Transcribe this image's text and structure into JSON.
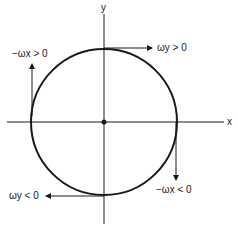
{
  "diagram": {
    "type": "circle-with-axes",
    "axes": {
      "x_label": "x",
      "y_label": "y"
    },
    "annotations": [
      {
        "id": "top",
        "label": "ωy > 0",
        "direction": "right"
      },
      {
        "id": "left",
        "label": "−ωx > 0",
        "direction": "up"
      },
      {
        "id": "right",
        "label": "−ωx < 0",
        "direction": "down"
      },
      {
        "id": "bottom",
        "label": "ωy < 0",
        "direction": "left"
      }
    ],
    "colors": {
      "stroke": "#1a1a1a",
      "background": "#ffffff"
    }
  }
}
